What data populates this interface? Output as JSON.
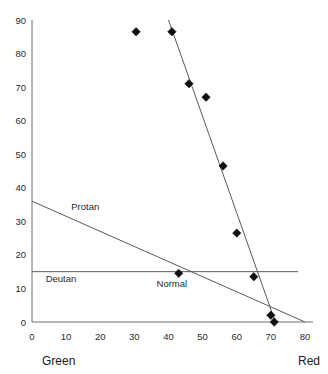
{
  "chart_data": {
    "type": "scatter",
    "title": "",
    "subtitle": "",
    "xlabel_left": "Green",
    "xlabel_right": "Red",
    "ylabel": "",
    "xlim": [
      0,
      80
    ],
    "ylim": [
      0,
      90
    ],
    "grid": false,
    "legend": "none",
    "x_ticks": [
      0,
      10,
      20,
      30,
      40,
      50,
      60,
      70,
      80
    ],
    "x_tick_labels": [
      "0",
      "10",
      "20",
      "30",
      "40",
      "50",
      "60",
      "70",
      "80"
    ],
    "y_ticks": [
      0,
      10,
      20,
      30,
      40,
      50,
      60,
      70,
      80,
      90
    ],
    "y_tick_labels": [
      "0",
      "10",
      "20",
      "30",
      "40",
      "50",
      "60",
      "70",
      "80",
      "90"
    ],
    "points": [
      {
        "x": 30.5,
        "y": 86.5
      },
      {
        "x": 41.0,
        "y": 86.5
      },
      {
        "x": 46.0,
        "y": 71.0
      },
      {
        "x": 51.0,
        "y": 67.0
      },
      {
        "x": 56.0,
        "y": 46.5
      },
      {
        "x": 60.0,
        "y": 26.5
      },
      {
        "x": 43.0,
        "y": 14.5
      },
      {
        "x": 65.0,
        "y": 13.5
      },
      {
        "x": 70.0,
        "y": 2.0
      },
      {
        "x": 71.0,
        "y": 0.0
      }
    ],
    "lines": [
      {
        "name": "regression-line",
        "label": "",
        "x1": 40.0,
        "y1": 90.0,
        "x2": 72.0,
        "y2": -2.0
      },
      {
        "name": "protan-line",
        "label": "Protan",
        "x1": 0.0,
        "y1": 36.0,
        "x2": 80.0,
        "y2": 0.0
      },
      {
        "name": "deutan-line",
        "label": "Deutan",
        "x1": 0.0,
        "y1": 15.0,
        "x2": 78.0,
        "y2": 15.0
      }
    ],
    "annotations": [
      {
        "name": "protan",
        "text": "Protan",
        "x": 11.5,
        "y": 33.5
      },
      {
        "name": "deutan",
        "text": "Deutan",
        "x": 4.0,
        "y": 12.0
      },
      {
        "name": "normal",
        "text": "Normal",
        "x": 36.5,
        "y": 10.5
      }
    ]
  },
  "colors": {
    "marker": "#111111",
    "line": "#5a5a5a",
    "axis": "#6e6e6e",
    "text": "#1a1a1a",
    "background": "#ffffff"
  }
}
